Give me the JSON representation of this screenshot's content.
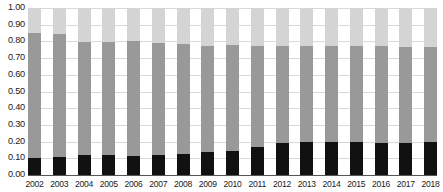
{
  "chart_data": {
    "type": "bar",
    "subtype": "stacked-100-percent",
    "title": "",
    "xlabel": "",
    "ylabel": "",
    "ylim": [
      0,
      1.0
    ],
    "ytick_labels": [
      "1.00",
      "0.90",
      "0.80",
      "0.70",
      "0.60",
      "0.50",
      "0.40",
      "0.30",
      "0.20",
      "0.10",
      "0.00"
    ],
    "ytick_values": [
      1.0,
      0.9,
      0.8,
      0.7,
      0.6,
      0.5,
      0.4,
      0.3,
      0.2,
      0.1,
      0.0
    ],
    "grid": true,
    "legend": "none",
    "categories": [
      "2002",
      "2003",
      "2004",
      "2005",
      "2006",
      "2007",
      "2008",
      "2009",
      "2010",
      "2011",
      "2012",
      "2013",
      "2014",
      "2015",
      "2016",
      "2017",
      "2018"
    ],
    "series": [
      {
        "name": "bottom-segment",
        "color": "#111111",
        "values": [
          0.1,
          0.105,
          0.12,
          0.12,
          0.115,
          0.12,
          0.125,
          0.135,
          0.145,
          0.165,
          0.19,
          0.2,
          0.195,
          0.195,
          0.19,
          0.19,
          0.2
        ]
      },
      {
        "name": "middle-segment",
        "color": "#999999",
        "values": [
          0.75,
          0.74,
          0.675,
          0.675,
          0.685,
          0.67,
          0.66,
          0.64,
          0.635,
          0.61,
          0.585,
          0.575,
          0.58,
          0.58,
          0.58,
          0.575,
          0.565
        ]
      },
      {
        "name": "top-segment",
        "color": "#d4d4d4",
        "values": [
          0.15,
          0.155,
          0.205,
          0.205,
          0.2,
          0.21,
          0.215,
          0.225,
          0.22,
          0.225,
          0.225,
          0.225,
          0.225,
          0.225,
          0.23,
          0.235,
          0.235
        ]
      }
    ],
    "cumulative_top_of_middle": [
      0.85,
      0.845,
      0.795,
      0.795,
      0.8,
      0.79,
      0.785,
      0.775,
      0.78,
      0.775,
      0.775,
      0.775,
      0.775,
      0.775,
      0.77,
      0.765,
      0.765
    ]
  },
  "colors": {
    "background": "#ffffff",
    "gridline": "#d9d9d9",
    "baseline": "#555555",
    "text": "#1a1a1a",
    "segment_bottom": "#111111",
    "segment_middle": "#999999",
    "segment_top": "#d4d4d4"
  }
}
